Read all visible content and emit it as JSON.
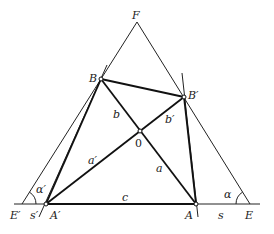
{
  "diagram": {
    "points": {
      "F": {
        "label": "F",
        "x": 137,
        "y": 22
      },
      "B": {
        "label": "B",
        "x": 101,
        "y": 79
      },
      "B_prime": {
        "label": "B′",
        "x": 184,
        "y": 97
      },
      "O": {
        "label": "0",
        "x": 140,
        "y": 131
      },
      "A_prime": {
        "label": "A′",
        "x": 46,
        "y": 204
      },
      "A": {
        "label": "A",
        "x": 196,
        "y": 204
      },
      "E_prime": {
        "label": "E′",
        "x": 22,
        "y": 204
      },
      "E": {
        "label": "E",
        "x": 250,
        "y": 204
      }
    },
    "segment_labels": {
      "a": "a",
      "a_prime": "a′",
      "b": "b",
      "b_prime": "b′",
      "c": "c",
      "s": "s",
      "s_prime": "s′",
      "alpha": "α",
      "alpha_prime": "α′"
    }
  }
}
